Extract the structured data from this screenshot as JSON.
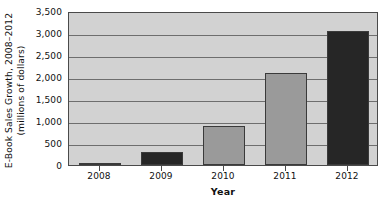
{
  "chart_data": {
    "type": "bar",
    "title": "",
    "categories": [
      "2008",
      "2009",
      "2010",
      "2011",
      "2012"
    ],
    "values": [
      50,
      300,
      880,
      2100,
      3050
    ],
    "xlabel": "Year",
    "ylabel": "E-Book Sales Growth, 2008–2012 (millions of dollars)",
    "ylabel_line1": "E-Book Sales Growth, 2008–2012",
    "ylabel_line2": "(millions of dollars)",
    "ylim": [
      0,
      3500
    ],
    "ytick_step": 500,
    "ytick_labels": [
      "0",
      "500",
      "1,000",
      "1,500",
      "2,000",
      "2,500",
      "3,000",
      "3,500"
    ],
    "ytick_values": [
      0,
      500,
      1000,
      1500,
      2000,
      2500,
      3000,
      3500
    ],
    "grid": true,
    "legend": false,
    "legend_position": "none",
    "bar_colors": [
      "#9a9a9a",
      "#262626",
      "#9a9a9a",
      "#9a9a9a",
      "#262626"
    ],
    "plot_background": "#d2d2d2",
    "gridline_color": "#6e6e6e",
    "axis_color": "#4a4a4a",
    "text_color": "#111111"
  }
}
